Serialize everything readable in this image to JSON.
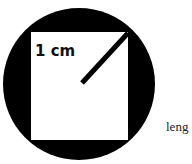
{
  "diagram": {
    "radius_label": "1 cm",
    "trailing_text": "leng",
    "colors": {
      "circle": "#000000",
      "square": "#ffffff",
      "background": "#ffffff"
    }
  }
}
